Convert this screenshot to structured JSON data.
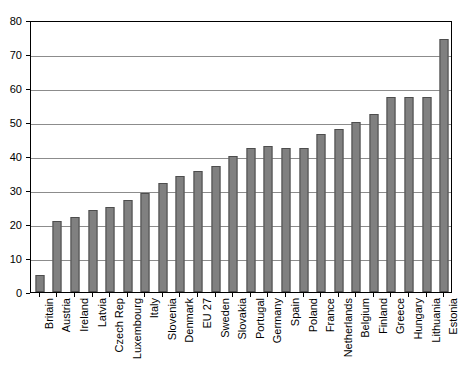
{
  "chart_data": {
    "type": "bar",
    "title": "",
    "subtitle": "",
    "xlabel": "",
    "ylabel": "",
    "ylim": [
      0,
      80
    ],
    "ytick_step": 10,
    "yticks": [
      0,
      10,
      20,
      30,
      40,
      50,
      60,
      70,
      80
    ],
    "ytick_labels": [
      "0",
      "10",
      "20",
      "30",
      "40",
      "50",
      "60",
      "70",
      "80"
    ],
    "grid": true,
    "grid_axis": "y",
    "legend": false,
    "legend_position": "none",
    "bar_color": "#808080",
    "bar_edge_color": "#4d4d4d",
    "gridline_color": "#8c8c8c",
    "axis_color": "#000000",
    "background_color": "#ffffff",
    "categories": [
      "Britain",
      "Austria",
      "Ireland",
      "Latvia",
      "Czech Rep",
      "Luxembourg",
      "Italy",
      "Slovenia",
      "Denmark",
      "EU 27",
      "Sweden",
      "Slovakia",
      "Portugal",
      "Germany",
      "Spain",
      "Poland",
      "France",
      "Netherlands",
      "Belgium",
      "Finland",
      "Greece",
      "Hungary",
      "Lithuania",
      "Estonia"
    ],
    "values": [
      5,
      21,
      22,
      24,
      25,
      27,
      29,
      32,
      34,
      35.5,
      37,
      40,
      42.5,
      43,
      42.5,
      42.5,
      46.5,
      48,
      50,
      52.5,
      57.5,
      57.5,
      57.5,
      74.5
    ]
  }
}
